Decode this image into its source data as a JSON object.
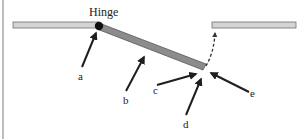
{
  "diagram": {
    "title_label": "Hinge",
    "labels": {
      "a": "a",
      "b": "b",
      "c": "c",
      "d": "d",
      "e": "e"
    },
    "colors": {
      "fixed_bar_fill": "#d4d4d4",
      "fixed_bar_stroke": "#6e6e6e",
      "moving_bar_fill": "#8c8c8c",
      "moving_bar_stroke": "#555555",
      "hinge": "#111111",
      "arrow": "#1e1e1e",
      "dashed_arrow": "#333333",
      "frame_line": "#bdbdbd"
    },
    "elements": [
      {
        "id": "left-bar",
        "desc": "fixed horizontal bar on left"
      },
      {
        "id": "hinge",
        "desc": "pivot point joining left bar and tilted bar"
      },
      {
        "id": "tilted-bar",
        "desc": "bar rotated downward from hinge"
      },
      {
        "id": "right-bar",
        "desc": "fixed horizontal bar on right"
      },
      {
        "id": "dashed-arrow",
        "desc": "dashed path showing bar swinging up to right bar"
      },
      {
        "id": "arrow-a",
        "points_to": "hinge"
      },
      {
        "id": "arrow-b",
        "points_to": "tilted bar body"
      },
      {
        "id": "arrow-c",
        "points_to": "tip of tilted bar"
      },
      {
        "id": "arrow-d",
        "points_to": "gap below tip"
      },
      {
        "id": "arrow-e",
        "points_to": "gap at start of dashed path"
      }
    ]
  }
}
